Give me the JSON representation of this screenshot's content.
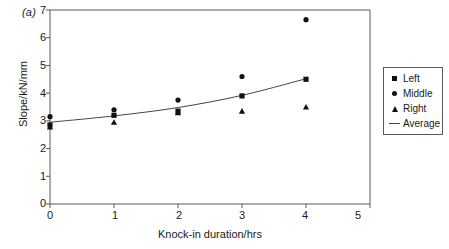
{
  "panel": {
    "label": "(a)"
  },
  "chart_data": {
    "type": "scatter",
    "title": "",
    "xlabel": "Knock-in duration/hrs",
    "ylabel": "Slope/kN/mm",
    "xlim": [
      0,
      5
    ],
    "ylim": [
      0,
      7
    ],
    "xticks": [
      0,
      1,
      2,
      3,
      4,
      5
    ],
    "xtick_labels": [
      "0",
      "1",
      "2",
      "3",
      "4",
      "5"
    ],
    "yticks": [
      0,
      1,
      2,
      3,
      4,
      5,
      6,
      7
    ],
    "ytick_labels": [
      "0",
      "1",
      "2",
      "3",
      "4",
      "5",
      "6",
      "7"
    ],
    "grid": false,
    "legend_position": "right",
    "x": [
      0,
      1,
      2,
      3,
      4
    ],
    "series": [
      {
        "name": "Left",
        "marker": "square",
        "values": [
          2.85,
          3.2,
          3.35,
          3.9,
          4.5
        ]
      },
      {
        "name": "Middle",
        "marker": "circle",
        "values": [
          3.15,
          3.4,
          3.75,
          4.6,
          6.65
        ]
      },
      {
        "name": "Right",
        "marker": "triangle",
        "values": [
          2.78,
          2.95,
          3.3,
          3.35,
          3.5
        ]
      },
      {
        "name": "Average",
        "marker": "line",
        "values": [
          2.95,
          3.18,
          3.48,
          3.92,
          4.52
        ]
      }
    ]
  },
  "legend": {
    "items": [
      {
        "label": "Left",
        "key": "square-marker-icon"
      },
      {
        "label": "Middle",
        "key": "circle-marker-icon"
      },
      {
        "label": "Right",
        "key": "triangle-marker-icon"
      },
      {
        "label": "Average",
        "key": "line-marker-icon"
      }
    ]
  },
  "colors": {
    "marker": "#111111",
    "axis": "#58585a",
    "curve": "#444444",
    "background": "#ffffff"
  }
}
